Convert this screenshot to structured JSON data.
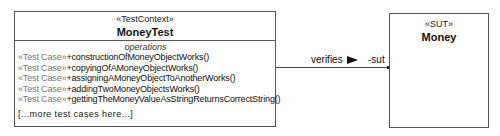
{
  "test_context": {
    "stereotype": "«TestContext»",
    "name": "MoneyTest",
    "operations_title": "operations",
    "operations": [
      {
        "stereotype": "«Test Case»",
        "signature": "+constructionOfMoneyObjectWorks()"
      },
      {
        "stereotype": "«Test Case»",
        "signature": "+copyingOfAMoneyObjectWorks()"
      },
      {
        "stereotype": "«Test Case»",
        "signature": "+assigningAMoneyObjectToAnotherWorks()"
      },
      {
        "stereotype": "«Test Case»",
        "signature": "+addingTwoMoneyObjectsWorks()"
      },
      {
        "stereotype": "«Test Case»",
        "signature": "+gettingTheMoneyValueAsStringReturnsCorrectString()"
      }
    ],
    "more_note": "[...more test cases here...]"
  },
  "sut": {
    "stereotype": "«SUT»",
    "name": "Money"
  },
  "association": {
    "name": "verifies",
    "direction_icon": "filled-triangle-right",
    "target_role": "-sut"
  },
  "colors": {
    "border": "#555555",
    "stereotype_prefix": "#777777",
    "text": "#111111"
  }
}
